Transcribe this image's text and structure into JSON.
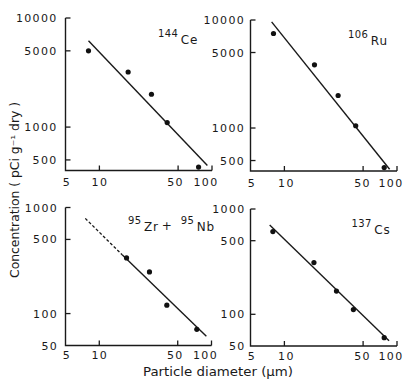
{
  "figure": {
    "ylabel": "Concentration  ( pCi g⁻¹ dry )",
    "xlabel": "Particle  diameter  (µm)",
    "ink_color": "#1a1a1a",
    "background_color": "#ffffff"
  },
  "chart_data": [
    {
      "type": "scatter",
      "title": "144Ce",
      "label_parts": [
        {
          "sup": "144",
          "text": "Ce"
        }
      ],
      "xlabel": "Particle diameter (µm)",
      "ylabel": "Concentration (pCi g⁻¹ dry)",
      "xscale": "log",
      "yscale": "log",
      "xlim": [
        5,
        100
      ],
      "ylim": [
        400,
        10000
      ],
      "xticks": [
        5,
        10,
        50,
        100
      ],
      "xtick_labels": [
        "5",
        "10",
        "50",
        "100"
      ],
      "yticks": [
        500,
        1000,
        5000,
        10000
      ],
      "ytick_labels": [
        "500",
        "1000",
        "5000",
        "10000"
      ],
      "grid": false,
      "points": {
        "x": [
          8,
          18,
          29,
          40,
          76
        ],
        "y": [
          5000,
          3200,
          2000,
          1100,
          430
        ]
      },
      "fit_line": {
        "solid": [
          [
            8,
            6200
          ],
          [
            91,
            445
          ]
        ]
      }
    },
    {
      "type": "scatter",
      "title": "106Ru",
      "label_parts": [
        {
          "sup": "106",
          "text": "Ru"
        }
      ],
      "xlabel": "Particle diameter (µm)",
      "ylabel": "Concentration (pCi g⁻¹ dry)",
      "xscale": "log",
      "yscale": "log",
      "xlim": [
        5,
        100
      ],
      "ylim": [
        400,
        10000
      ],
      "xticks": [
        5,
        10,
        50,
        100
      ],
      "xtick_labels": [
        "5",
        "10",
        "50",
        "100"
      ],
      "yticks": [
        500,
        1000,
        5000,
        10000
      ],
      "ytick_labels": [
        "500",
        "1000",
        "5000",
        "10000"
      ],
      "grid": false,
      "points": {
        "x": [
          8,
          18.5,
          30,
          43,
          77
        ],
        "y": [
          7500,
          3850,
          2000,
          1050,
          430
        ]
      },
      "fit_line": {
        "solid": [
          [
            7.7,
            9600
          ],
          [
            86,
            415
          ]
        ]
      }
    },
    {
      "type": "scatter",
      "title": "95Zr + 95Nb",
      "label_parts": [
        {
          "sup": "95",
          "text": "Zr"
        },
        {
          "text": "+"
        },
        {
          "sup": "95",
          "text": "Nb"
        }
      ],
      "xlabel": "Particle diameter (µm)",
      "ylabel": "Concentration (pCi g⁻¹ dry)",
      "xscale": "log",
      "yscale": "log",
      "xlim": [
        5,
        100
      ],
      "ylim": [
        50,
        1000
      ],
      "xticks": [
        5,
        10,
        50,
        100
      ],
      "xtick_labels": [
        "5",
        "10",
        "50",
        "100"
      ],
      "yticks": [
        50,
        100,
        500,
        1000
      ],
      "ytick_labels": [
        "50",
        "100",
        "500",
        "1000"
      ],
      "grid": false,
      "points": {
        "x": [
          17.5,
          28,
          40,
          74
        ],
        "y": [
          335,
          247,
          120,
          71
        ]
      },
      "fit_line": {
        "dashed": [
          [
            7.5,
            790
          ],
          [
            16,
            358
          ]
        ],
        "solid": [
          [
            16,
            358
          ],
          [
            90,
            61
          ]
        ]
      }
    },
    {
      "type": "scatter",
      "title": "137Cs",
      "label_parts": [
        {
          "sup": "137",
          "text": "Cs"
        }
      ],
      "xlabel": "Particle diameter (µm)",
      "ylabel": "Concentration (pCi g⁻¹ dry)",
      "xscale": "log",
      "yscale": "log",
      "xlim": [
        5,
        100
      ],
      "ylim": [
        50,
        1000
      ],
      "xticks": [
        5,
        10,
        50,
        100
      ],
      "xtick_labels": [
        "5",
        "10",
        "50",
        "100"
      ],
      "yticks": [
        50,
        100,
        500,
        1000
      ],
      "ytick_labels": [
        "50",
        "100",
        "500",
        "1000"
      ],
      "grid": false,
      "points": {
        "x": [
          7.9,
          18.3,
          29,
          41,
          77
        ],
        "y": [
          610,
          310,
          166,
          111,
          60
        ]
      },
      "fit_line": {
        "solid": [
          [
            7.4,
            705
          ],
          [
            85,
            56
          ]
        ]
      }
    }
  ]
}
